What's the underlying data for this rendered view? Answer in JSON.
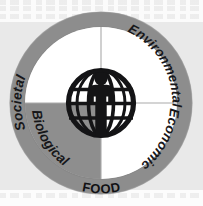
{
  "diagram": {
    "center_icon": "globe-person-icon",
    "ring_label": "FOOD",
    "quadrants": [
      {
        "id": "societal",
        "label": "Societal",
        "position": "upper-left",
        "fill": "#ffffff"
      },
      {
        "id": "environmental",
        "label": "Environmental",
        "position": "upper-right",
        "fill": "#ffffff"
      },
      {
        "id": "biological",
        "label": "Biological",
        "position": "lower-left",
        "fill": "#8e8e8e"
      },
      {
        "id": "economic",
        "label": "Economic",
        "position": "lower-right",
        "fill": "#ffffff"
      }
    ],
    "colors": {
      "ring": "#8d8d8d",
      "ring_shadow": "#7c7c7c",
      "quadrant_white": "#ffffff",
      "quadrant_gray": "#8e8e8e",
      "divider": "#a9a9a9",
      "icon": "#141416",
      "text": "#17171a",
      "page_background": "#e9e9e9"
    }
  }
}
